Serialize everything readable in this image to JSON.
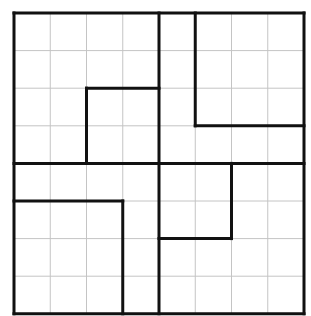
{
  "diagram": {
    "type": "grid-partition-puzzle",
    "caption_fragment": "",
    "grid": {
      "cols": 8,
      "rows": 8,
      "origin_px": [
        14,
        13
      ],
      "cell_w_px": 36.25,
      "cell_h_px": 37.6,
      "grid_line_color": "#c4c4c4",
      "thick_line_color": "#111111"
    },
    "thick_segments": [
      {
        "name": "outer-top",
        "from": [
          0,
          0
        ],
        "to": [
          8,
          0
        ]
      },
      {
        "name": "outer-bottom",
        "from": [
          0,
          8
        ],
        "to": [
          8,
          8
        ]
      },
      {
        "name": "outer-left",
        "from": [
          0,
          0
        ],
        "to": [
          0,
          8
        ]
      },
      {
        "name": "outer-right",
        "from": [
          8,
          0
        ],
        "to": [
          8,
          8
        ]
      },
      {
        "name": "center-vertical",
        "from": [
          4,
          0
        ],
        "to": [
          4,
          8
        ]
      },
      {
        "name": "center-horizontal",
        "from": [
          0,
          4
        ],
        "to": [
          8,
          4
        ]
      },
      {
        "name": "top-left-inner-h",
        "from": [
          2,
          2
        ],
        "to": [
          4,
          2
        ]
      },
      {
        "name": "top-left-inner-v",
        "from": [
          2,
          2
        ],
        "to": [
          2,
          4
        ]
      },
      {
        "name": "top-right-inner-v",
        "from": [
          5,
          0
        ],
        "to": [
          5,
          3
        ]
      },
      {
        "name": "top-right-inner-h",
        "from": [
          5,
          3
        ],
        "to": [
          8,
          3
        ]
      },
      {
        "name": "bottom-left-inner-h",
        "from": [
          0,
          5
        ],
        "to": [
          3,
          5
        ]
      },
      {
        "name": "bottom-left-inner-v",
        "from": [
          3,
          5
        ],
        "to": [
          3,
          8
        ]
      },
      {
        "name": "bottom-right-inner-v",
        "from": [
          6,
          4
        ],
        "to": [
          6,
          6
        ]
      },
      {
        "name": "bottom-right-inner-h",
        "from": [
          4,
          6
        ],
        "to": [
          6,
          6
        ]
      }
    ]
  }
}
